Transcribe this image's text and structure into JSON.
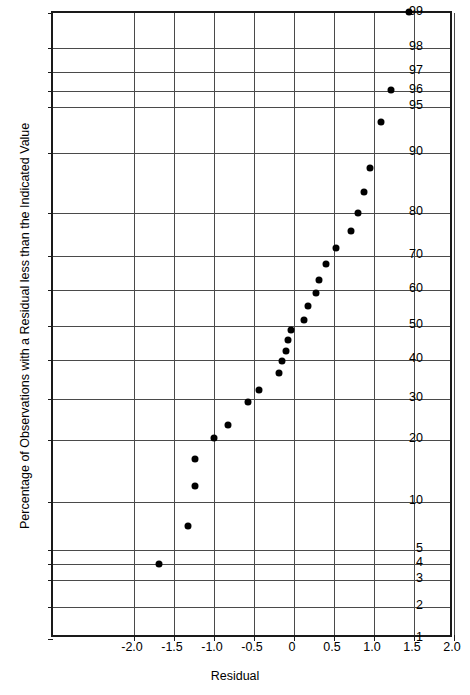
{
  "chart_data": {
    "type": "scatter",
    "title": "",
    "subtitle": "",
    "xlabel": "Residual",
    "ylabel": "Percentage of Observations with a Residual less than the Indicated Value",
    "scale_note": "normal probability plot; y-axis uses normal probability scale",
    "grid": true,
    "legend": "none",
    "xlim": [
      -2.25,
      2.75
    ],
    "xticks": [
      "-2.0",
      "-1.5",
      "-1.0",
      "-0.5",
      "0",
      "0.5",
      "1.0",
      "1.5",
      "2.0"
    ],
    "xtick_values": [
      -2.0,
      -1.5,
      -1.0,
      -0.5,
      0,
      0.5,
      1.0,
      1.5,
      2.0
    ],
    "ylim": [
      1,
      99
    ],
    "yticks": [
      "99",
      "98",
      "97",
      "96",
      "95",
      "90",
      "80",
      "70",
      "60",
      "50",
      "40",
      "30",
      "20",
      "10",
      "5",
      "4",
      "3",
      "2",
      "1"
    ],
    "ytick_values": [
      99,
      98,
      97,
      96,
      95,
      90,
      80,
      70,
      60,
      50,
      40,
      30,
      20,
      10,
      5,
      4,
      3,
      2,
      1
    ],
    "series": [
      {
        "name": "Residuals",
        "marker": "filled-circle",
        "color": "#000000",
        "points": [
          {
            "x": -1.69,
            "y": 4.0
          },
          {
            "x": -1.32,
            "y": 7.0
          },
          {
            "x": -1.24,
            "y": 12.0
          },
          {
            "x": -1.24,
            "y": 16.5
          },
          {
            "x": -1.0,
            "y": 20.5
          },
          {
            "x": -0.83,
            "y": 23.5
          },
          {
            "x": -0.57,
            "y": 29.0
          },
          {
            "x": -0.44,
            "y": 32.0
          },
          {
            "x": -0.19,
            "y": 36.5
          },
          {
            "x": -0.15,
            "y": 40.0
          },
          {
            "x": -0.1,
            "y": 43.0
          },
          {
            "x": -0.08,
            "y": 46.0
          },
          {
            "x": -0.04,
            "y": 49.0
          },
          {
            "x": 0.12,
            "y": 52.0
          },
          {
            "x": 0.17,
            "y": 56.0
          },
          {
            "x": 0.27,
            "y": 60.0
          },
          {
            "x": 0.31,
            "y": 63.5
          },
          {
            "x": 0.4,
            "y": 68.0
          },
          {
            "x": 0.52,
            "y": 72.0
          },
          {
            "x": 0.71,
            "y": 76.0
          },
          {
            "x": 0.8,
            "y": 80.0
          },
          {
            "x": 0.88,
            "y": 84.0
          },
          {
            "x": 0.95,
            "y": 88.0
          },
          {
            "x": 1.09,
            "y": 93.5
          },
          {
            "x": 1.21,
            "y": 96.0
          },
          {
            "x": 1.44,
            "y": 99.0
          }
        ]
      }
    ]
  },
  "axes": {
    "x_title": "Residual",
    "y_title": "Percentage of Observations with a Residual less than the Indicated Value"
  }
}
